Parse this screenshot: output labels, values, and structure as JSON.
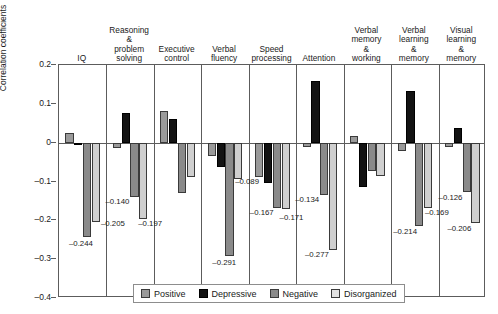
{
  "chart_data": {
    "type": "bar",
    "title": "",
    "xlabel": "",
    "ylabel": "Correlation coefficients",
    "ylim": [
      -0.4,
      0.2
    ],
    "ytick_labels": [
      "0.2",
      "0.1",
      "0",
      "–0.1",
      "–0.2",
      "–0.3",
      "–0.4"
    ],
    "ytick_values": [
      0.2,
      0.1,
      0,
      -0.1,
      -0.2,
      -0.3,
      -0.4
    ],
    "grid": false,
    "legend_position": "bottom",
    "categories": [
      "IQ",
      "Reasoning\n&\nproblem\nsolving",
      "Executive\ncontrol",
      "Verbal\nfluency",
      "Speed\nprocessing",
      "Attention",
      "Verbal\nmemory\n&\nworking",
      "Verbal\nlearning\n&\nmemory",
      "Visual\nlearning\n&\nmemory"
    ],
    "series": [
      {
        "name": "Positive",
        "color": "#9a9a9a",
        "values": [
          0.024,
          -0.014,
          0.082,
          -0.035,
          -0.089,
          -0.012,
          0.016,
          -0.022,
          -0.011
        ],
        "labels": [
          "",
          "",
          "",
          "",
          "–0.089",
          "",
          "",
          "",
          ""
        ]
      },
      {
        "name": "Depressive",
        "color": "#131313",
        "values": [
          0.0,
          0.077,
          0.062,
          -0.062,
          -0.104,
          0.158,
          -0.113,
          0.132,
          0.038
        ],
        "labels": [
          "",
          "",
          "",
          "",
          "",
          "",
          "",
          "",
          ""
        ]
      },
      {
        "name": "Negative",
        "color": "#8a8a8a",
        "values": [
          -0.244,
          -0.14,
          -0.13,
          -0.291,
          -0.167,
          -0.134,
          -0.074,
          -0.214,
          -0.126
        ],
        "labels": [
          "–0.244",
          "–0.140",
          "",
          "–0.291",
          "–0.167",
          "–0.134",
          "",
          "–0.214",
          "–0.126"
        ]
      },
      {
        "name": "Disorganized",
        "color": "#cfcfcf",
        "values": [
          -0.205,
          -0.197,
          -0.088,
          -0.093,
          -0.171,
          -0.277,
          -0.086,
          -0.169,
          -0.206
        ],
        "labels": [
          "–0.205",
          "–0.197",
          "",
          "",
          "–0.171",
          "–0.277",
          "",
          "–0.169",
          "–0.206"
        ]
      }
    ]
  },
  "axis": {
    "y_title": "Correlation coefficients",
    "ticks": [
      {
        "label": "0.2"
      },
      {
        "label": "0.1"
      },
      {
        "label": "0"
      },
      {
        "label": "–0.1"
      },
      {
        "label": "–0.2"
      },
      {
        "label": "–0.3"
      },
      {
        "label": "–0.4"
      }
    ]
  },
  "headers": [
    {
      "label": "IQ"
    },
    {
      "label": "Reasoning\n&\nproblem\nsolving"
    },
    {
      "label": "Executive\ncontrol"
    },
    {
      "label": "Verbal\nfluency"
    },
    {
      "label": "Speed\nprocessing"
    },
    {
      "label": "Attention"
    },
    {
      "label": "Verbal\nmemory\n&\nworking"
    },
    {
      "label": "Verbal\nlearning\n&\nmemory"
    },
    {
      "label": "Visual\nlearning\n&\nmemory"
    }
  ],
  "legend": {
    "items": [
      {
        "label": "Positive",
        "key": "positive"
      },
      {
        "label": "Depressive",
        "key": "depressive"
      },
      {
        "label": "Negative",
        "key": "negative"
      },
      {
        "label": "Disorganized",
        "key": "disorganized"
      }
    ]
  }
}
